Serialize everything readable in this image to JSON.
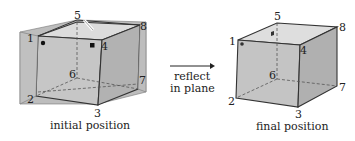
{
  "diagram": {
    "left_cube": {
      "caption": "initial position",
      "vertices": {
        "v1": "1",
        "v2": "2",
        "v3": "3",
        "v4": "4",
        "v5": "5",
        "v6": "6",
        "v7": "7",
        "v8": "8"
      },
      "markers": [
        "circle at vertex 1",
        "square at vertex 4"
      ],
      "has_reflection_plane": true
    },
    "arrow": {
      "label_line1": "reflect",
      "label_line2": "in plane"
    },
    "right_cube": {
      "caption": "final position",
      "vertices": {
        "v1": "1",
        "v2": "2",
        "v3": "3",
        "v4": "4",
        "v5": "5",
        "v6": "6",
        "v7": "7",
        "v8": "8"
      },
      "markers": [
        "circle at vertex 1",
        "square near vertex 5"
      ]
    },
    "colors": {
      "plane": "#b8b8b8",
      "face_front": "#c4c4c4",
      "face_top": "#dedede",
      "face_right": "#b0b0b0",
      "edge": "#333333"
    }
  }
}
